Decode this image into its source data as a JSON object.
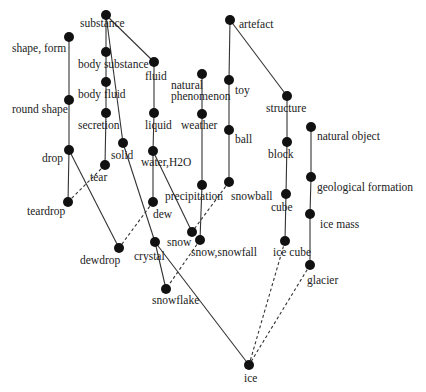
{
  "diagram": {
    "type": "concept lattice / taxonomy graph",
    "colors": {
      "node": "#111111",
      "edge": "#333333",
      "label": "#222222",
      "background": "#ffffff"
    },
    "nodes": [
      {
        "id": "substance",
        "label": [
          "substance"
        ],
        "x": 106,
        "y": 15,
        "lx": 80,
        "ly": 27
      },
      {
        "id": "shape_form",
        "label": [
          "shape, form"
        ],
        "x": 69,
        "y": 37,
        "lx": 12,
        "ly": 52
      },
      {
        "id": "body_substance",
        "label": [
          "body substance"
        ],
        "x": 106,
        "y": 52,
        "lx": 78,
        "ly": 68
      },
      {
        "id": "fluid",
        "label": [
          "fluid"
        ],
        "x": 154,
        "y": 62,
        "lx": 145,
        "ly": 80
      },
      {
        "id": "natural_phenomenon",
        "label": [
          "natural",
          "phenomenon"
        ],
        "x": 202,
        "y": 74,
        "lx": 171,
        "ly": 89
      },
      {
        "id": "artefact",
        "label": [
          "artefact"
        ],
        "x": 230,
        "y": 20,
        "lx": 239,
        "ly": 28
      },
      {
        "id": "toy",
        "label": [
          "toy"
        ],
        "x": 229,
        "y": 80,
        "lx": 235,
        "ly": 94
      },
      {
        "id": "structure",
        "label": [
          "structure"
        ],
        "x": 287,
        "y": 96,
        "lx": 266,
        "ly": 112
      },
      {
        "id": "body_fluid",
        "label": [
          "body fluid"
        ],
        "x": 106,
        "y": 82,
        "lx": 78,
        "ly": 98
      },
      {
        "id": "round_shape",
        "label": [
          "round shape"
        ],
        "x": 69,
        "y": 100,
        "lx": 12,
        "ly": 113
      },
      {
        "id": "secretion",
        "label": [
          "secretion"
        ],
        "x": 106,
        "y": 113,
        "lx": 78,
        "ly": 129
      },
      {
        "id": "liquid",
        "label": [
          "liquid"
        ],
        "x": 154,
        "y": 113,
        "lx": 145,
        "ly": 129
      },
      {
        "id": "weather",
        "label": [
          "weather"
        ],
        "x": 202,
        "y": 114,
        "lx": 181,
        "ly": 129
      },
      {
        "id": "ball",
        "label": [
          "ball"
        ],
        "x": 229,
        "y": 130,
        "lx": 235,
        "ly": 143
      },
      {
        "id": "natural_object",
        "label": [
          "natural object"
        ],
        "x": 311,
        "y": 127,
        "lx": 317,
        "ly": 140
      },
      {
        "id": "block",
        "label": [
          "block"
        ],
        "x": 287,
        "y": 142,
        "lx": 268,
        "ly": 158
      },
      {
        "id": "drop",
        "label": [
          "drop"
        ],
        "x": 69,
        "y": 150,
        "lx": 42,
        "ly": 162
      },
      {
        "id": "solid",
        "label": [
          "solid"
        ],
        "x": 123,
        "y": 143,
        "lx": 111,
        "ly": 159
      },
      {
        "id": "water_h2o",
        "label": [
          "water,H2O"
        ],
        "x": 153,
        "y": 151,
        "lx": 141,
        "ly": 166
      },
      {
        "id": "tear",
        "label": [
          "tear"
        ],
        "x": 105,
        "y": 165,
        "lx": 90,
        "ly": 181
      },
      {
        "id": "precipitation",
        "label": [
          "precipitation"
        ],
        "x": 202,
        "y": 185,
        "lx": 165,
        "ly": 200
      },
      {
        "id": "snowball",
        "label": [
          "snowball"
        ],
        "x": 229,
        "y": 182,
        "lx": 231,
        "ly": 200
      },
      {
        "id": "geological_formation",
        "label": [
          "geological formation"
        ],
        "x": 311,
        "y": 177,
        "lx": 317,
        "ly": 191
      },
      {
        "id": "cube",
        "label": [
          "cube"
        ],
        "x": 286,
        "y": 194,
        "lx": 271,
        "ly": 211
      },
      {
        "id": "teardrop",
        "label": [
          "teardrop"
        ],
        "x": 68,
        "y": 202,
        "lx": 27,
        "ly": 215
      },
      {
        "id": "dew",
        "label": [
          "dew"
        ],
        "x": 153,
        "y": 202,
        "lx": 153,
        "ly": 218
      },
      {
        "id": "ice_mass",
        "label": [
          "ice mass"
        ],
        "x": 310,
        "y": 214,
        "lx": 320,
        "ly": 228
      },
      {
        "id": "snow",
        "label": [
          "snow"
        ],
        "x": 192,
        "y": 232,
        "lx": 167,
        "ly": 246
      },
      {
        "id": "snow_snowfall",
        "label": [
          "snow,snowfall"
        ],
        "x": 200,
        "y": 240,
        "lx": 191,
        "ly": 256
      },
      {
        "id": "dewdrop",
        "label": [
          "dewdrop"
        ],
        "x": 119,
        "y": 248,
        "lx": 80,
        "ly": 264
      },
      {
        "id": "crystal",
        "label": [
          "crystal"
        ],
        "x": 155,
        "y": 242,
        "lx": 134,
        "ly": 260
      },
      {
        "id": "ice_cube",
        "label": [
          "ice cube"
        ],
        "x": 285,
        "y": 241,
        "lx": 273,
        "ly": 256
      },
      {
        "id": "glacier",
        "label": [
          "glacier"
        ],
        "x": 310,
        "y": 265,
        "lx": 307,
        "ly": 284
      },
      {
        "id": "snowflake",
        "label": [
          "snowflake"
        ],
        "x": 166,
        "y": 289,
        "lx": 152,
        "ly": 304
      },
      {
        "id": "ice",
        "label": [
          "ice"
        ],
        "x": 249,
        "y": 365,
        "lx": 244,
        "ly": 382
      }
    ],
    "edges": [
      {
        "from": "substance",
        "to": "body_substance",
        "style": "solid"
      },
      {
        "from": "substance",
        "to": "fluid",
        "style": "solid"
      },
      {
        "from": "substance",
        "to": "solid",
        "style": "solid"
      },
      {
        "from": "body_substance",
        "to": "body_fluid",
        "style": "solid"
      },
      {
        "from": "body_fluid",
        "to": "secretion",
        "style": "solid"
      },
      {
        "from": "secretion",
        "to": "tear",
        "style": "solid"
      },
      {
        "from": "shape_form",
        "to": "round_shape",
        "style": "solid"
      },
      {
        "from": "round_shape",
        "to": "drop",
        "style": "solid"
      },
      {
        "from": "drop",
        "to": "teardrop",
        "style": "solid"
      },
      {
        "from": "drop",
        "to": "dewdrop",
        "style": "solid"
      },
      {
        "from": "tear",
        "to": "teardrop",
        "style": "dashed"
      },
      {
        "from": "fluid",
        "to": "liquid",
        "style": "solid"
      },
      {
        "from": "liquid",
        "to": "water_h2o",
        "style": "solid"
      },
      {
        "from": "water_h2o",
        "to": "dew",
        "style": "solid"
      },
      {
        "from": "water_h2o",
        "to": "snow",
        "style": "solid"
      },
      {
        "from": "dew",
        "to": "dewdrop",
        "style": "dashed"
      },
      {
        "from": "solid",
        "to": "crystal",
        "style": "solid"
      },
      {
        "from": "crystal",
        "to": "snowflake",
        "style": "solid"
      },
      {
        "from": "crystal",
        "to": "ice",
        "style": "solid"
      },
      {
        "from": "natural_phenomenon",
        "to": "weather",
        "style": "solid"
      },
      {
        "from": "weather",
        "to": "precipitation",
        "style": "solid"
      },
      {
        "from": "precipitation",
        "to": "snow_snowfall",
        "style": "solid"
      },
      {
        "from": "snow_snowfall",
        "to": "snowflake",
        "style": "dashed"
      },
      {
        "from": "snowball",
        "to": "snow",
        "style": "dashed"
      },
      {
        "from": "artefact",
        "to": "toy",
        "style": "solid"
      },
      {
        "from": "artefact",
        "to": "structure",
        "style": "solid"
      },
      {
        "from": "toy",
        "to": "ball",
        "style": "solid"
      },
      {
        "from": "ball",
        "to": "snowball",
        "style": "solid"
      },
      {
        "from": "structure",
        "to": "block",
        "style": "solid"
      },
      {
        "from": "block",
        "to": "cube",
        "style": "solid"
      },
      {
        "from": "cube",
        "to": "ice_cube",
        "style": "solid"
      },
      {
        "from": "ice_cube",
        "to": "ice",
        "style": "dashed"
      },
      {
        "from": "natural_object",
        "to": "geological_formation",
        "style": "solid"
      },
      {
        "from": "geological_formation",
        "to": "ice_mass",
        "style": "solid"
      },
      {
        "from": "ice_mass",
        "to": "glacier",
        "style": "solid"
      },
      {
        "from": "glacier",
        "to": "ice",
        "style": "dashed"
      }
    ]
  }
}
